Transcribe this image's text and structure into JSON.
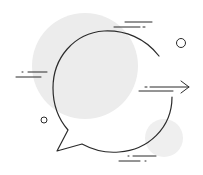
{
  "illustration": {
    "subject": "speech-bubble-with-arrow",
    "colors": {
      "background": "#ffffff",
      "blob": "#ececec",
      "stroke": "#2b2b2b"
    }
  }
}
